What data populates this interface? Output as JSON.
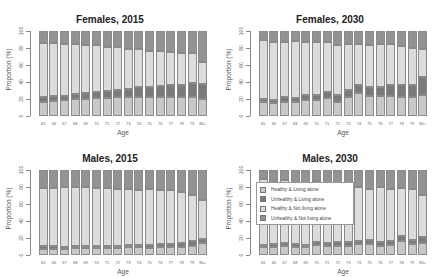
{
  "chart_data": [
    {
      "type": "bar",
      "stacked": true,
      "title": "Females, 2015",
      "xlabel": "Age",
      "ylabel": "Proportion (%)",
      "ylim": [
        0,
        100
      ],
      "yticks": [
        0,
        20,
        40,
        60,
        80,
        100
      ],
      "categories": [
        "65",
        "66",
        "67",
        "68",
        "69",
        "70",
        "71",
        "72",
        "73",
        "74",
        "75",
        "76",
        "77",
        "78",
        "79",
        "80+"
      ],
      "series": [
        {
          "name": "Healthy & Living alone",
          "values": [
            17,
            18,
            19,
            20,
            20,
            21,
            21,
            22,
            22,
            22,
            22,
            22,
            22,
            22,
            22,
            20
          ]
        },
        {
          "name": "Unhealthy & Living alone",
          "values": [
            5,
            5,
            5,
            6,
            7,
            7,
            8,
            9,
            10,
            12,
            12,
            13,
            14,
            15,
            17,
            18
          ]
        },
        {
          "name": "Healthy & Not living alone",
          "values": [
            64,
            63,
            61,
            59,
            57,
            55,
            52,
            50,
            47,
            45,
            43,
            41,
            39,
            37,
            35,
            26
          ]
        },
        {
          "name": "Unhealthy & Not living alone",
          "values": [
            14,
            14,
            15,
            15,
            16,
            17,
            19,
            19,
            21,
            21,
            23,
            24,
            25,
            26,
            26,
            36
          ]
        }
      ]
    },
    {
      "type": "bar",
      "stacked": true,
      "title": "Females, 2030",
      "xlabel": "Age",
      "ylabel": "Proportion (%)",
      "ylim": [
        0,
        100
      ],
      "yticks": [
        0,
        20,
        40,
        60,
        80,
        100
      ],
      "categories": [
        "65",
        "66",
        "67",
        "68",
        "69",
        "70",
        "71",
        "72",
        "73",
        "74",
        "75",
        "76",
        "77",
        "78",
        "79",
        "80+"
      ],
      "series": [
        {
          "name": "Healthy & Living alone",
          "values": [
            16,
            15,
            17,
            16,
            19,
            19,
            21,
            17,
            22,
            27,
            24,
            24,
            24,
            22,
            22,
            25
          ]
        },
        {
          "name": "Unhealthy & Living alone",
          "values": [
            4,
            4,
            5,
            5,
            6,
            6,
            7,
            8,
            9,
            9,
            10,
            10,
            13,
            14,
            14,
            21
          ]
        },
        {
          "name": "Healthy & Not living alone",
          "values": [
            69,
            68,
            65,
            67,
            62,
            62,
            59,
            58,
            54,
            49,
            49,
            51,
            48,
            46,
            44,
            33
          ]
        },
        {
          "name": "Unhealthy & Not living alone",
          "values": [
            11,
            13,
            13,
            12,
            13,
            13,
            13,
            17,
            15,
            15,
            17,
            15,
            15,
            18,
            20,
            21
          ]
        }
      ]
    },
    {
      "type": "bar",
      "stacked": true,
      "title": "Males, 2015",
      "xlabel": "Age",
      "ylabel": "Proportion (%)",
      "ylim": [
        0,
        100
      ],
      "yticks": [
        0,
        20,
        40,
        60,
        80,
        100
      ],
      "categories": [
        "65",
        "66",
        "67",
        "68",
        "69",
        "70",
        "71",
        "72",
        "73",
        "74",
        "75",
        "76",
        "77",
        "78",
        "79",
        "80+"
      ],
      "series": [
        {
          "name": "Healthy & Living alone",
          "values": [
            7,
            7,
            7,
            8,
            8,
            8,
            8,
            8,
            9,
            9,
            8,
            9,
            9,
            10,
            11,
            14
          ]
        },
        {
          "name": "Unhealthy & Living alone",
          "values": [
            4,
            4,
            3,
            3,
            3,
            3,
            3,
            3,
            3,
            3,
            4,
            4,
            4,
            4,
            5,
            5
          ]
        },
        {
          "name": "Healthy & Not living alone",
          "values": [
            68,
            68,
            70,
            69,
            69,
            68,
            68,
            67,
            66,
            65,
            66,
            64,
            63,
            60,
            55,
            46
          ]
        },
        {
          "name": "Unhealthy & Not living alone",
          "values": [
            21,
            21,
            20,
            20,
            20,
            21,
            21,
            22,
            22,
            23,
            22,
            23,
            24,
            26,
            29,
            35
          ]
        }
      ]
    },
    {
      "type": "bar",
      "stacked": true,
      "title": "Males, 2030",
      "xlabel": "Age",
      "ylabel": "Proportion (%)",
      "ylim": [
        0,
        100
      ],
      "yticks": [
        0,
        20,
        40,
        60,
        80,
        100
      ],
      "categories": [
        "65",
        "66",
        "67",
        "68",
        "69",
        "70",
        "71",
        "72",
        "73",
        "74",
        "75",
        "76",
        "77",
        "78",
        "79",
        "80+"
      ],
      "series": [
        {
          "name": "Healthy & Living alone",
          "values": [
            9,
            10,
            11,
            10,
            9,
            12,
            11,
            11,
            11,
            13,
            13,
            11,
            12,
            16,
            13,
            14
          ]
        },
        {
          "name": "Unhealthy & Living alone",
          "values": [
            3,
            3,
            3,
            3,
            3,
            3,
            3,
            4,
            4,
            4,
            5,
            4,
            5,
            6,
            5,
            7
          ]
        },
        {
          "name": "Healthy & Not living alone",
          "values": [
            78,
            73,
            74,
            70,
            71,
            72,
            67,
            66,
            66,
            63,
            60,
            65,
            61,
            57,
            60,
            50
          ]
        },
        {
          "name": "Unhealthy & Not living alone",
          "values": [
            10,
            14,
            12,
            17,
            17,
            13,
            19,
            19,
            19,
            20,
            22,
            20,
            22,
            21,
            22,
            29
          ]
        }
      ]
    }
  ],
  "legend": {
    "items": [
      {
        "label": "Healthy & Living alone",
        "color": "#c8c8c8"
      },
      {
        "label": "Unhealthy & Living alone",
        "color": "#7a7a7a"
      },
      {
        "label": "Healthy & Not living alone",
        "color": "#dcdcdc"
      },
      {
        "label": "Unhealthy & Not living alone",
        "color": "#939393"
      }
    ]
  },
  "colors": [
    "#c8c8c8",
    "#7a7a7a",
    "#dcdcdc",
    "#939393"
  ]
}
